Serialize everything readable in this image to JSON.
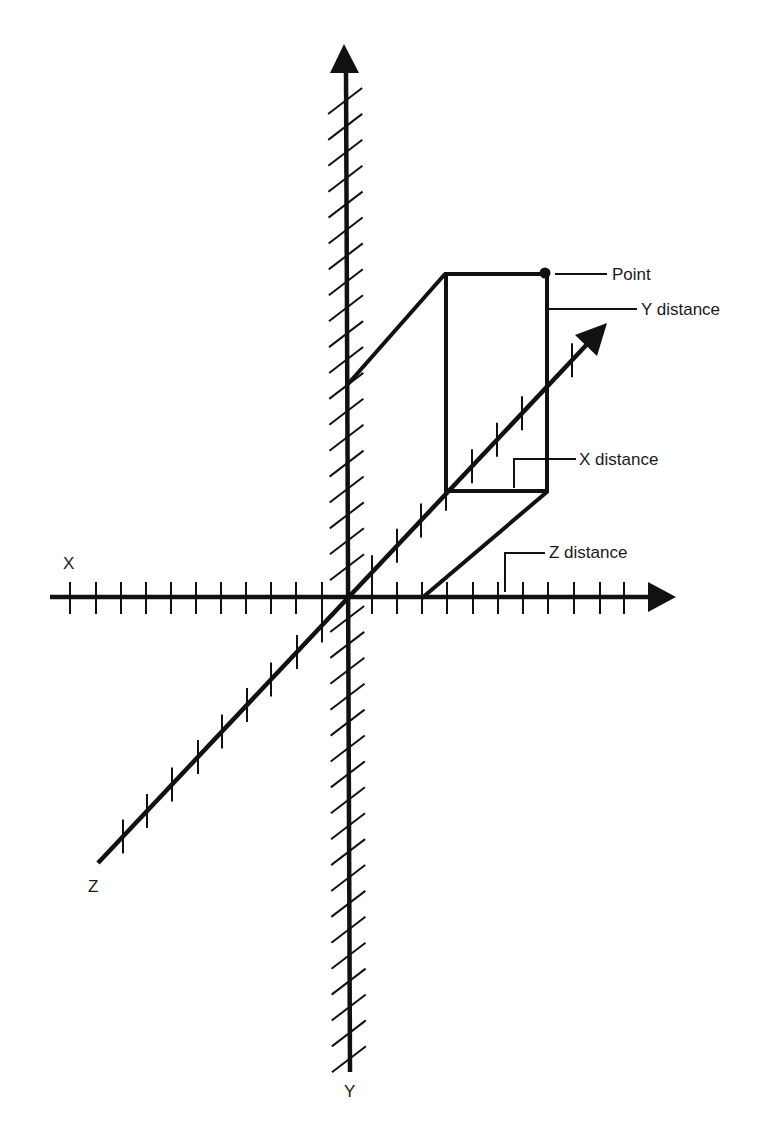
{
  "diagram": {
    "axes": {
      "x_label": "X",
      "y_label": "Y",
      "z_label": "Z"
    },
    "point": {
      "label": "Point",
      "annotations": [
        "Y distance",
        "X distance",
        "Z distance"
      ]
    },
    "labels": {
      "point": "Point",
      "y_distance": "Y distance",
      "x_distance": "X distance",
      "z_distance": "Z distance"
    },
    "colors": {
      "stroke": "#111111",
      "background": "#ffffff",
      "text": "#1a1a1a"
    }
  }
}
